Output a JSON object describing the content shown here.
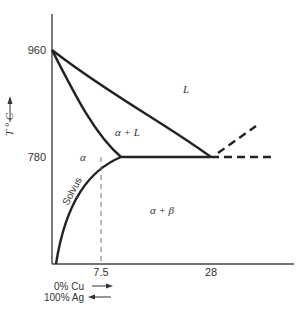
{
  "diagram": {
    "type": "phase-diagram",
    "system": "Ag-Cu",
    "y_axis": {
      "label": "T ° C",
      "ticks": [
        {
          "value": "960",
          "y": 50
        },
        {
          "value": "780",
          "y": 157
        }
      ]
    },
    "x_axis": {
      "ticks": [
        {
          "value": "7.5",
          "x": 101
        },
        {
          "value": "28",
          "x": 211
        }
      ],
      "composition_labels": [
        {
          "text": "0% Cu",
          "arrow": "right"
        },
        {
          "text": "100% Ag",
          "arrow": "left"
        }
      ]
    },
    "regions": {
      "liquid": "L",
      "alpha_liquid": "α + L",
      "alpha": "α",
      "alpha_beta": "α + β",
      "solvus": "Solvus"
    },
    "points": {
      "melting_point_ag": {
        "T": 960,
        "x_pct": 0
      },
      "max_solubility": {
        "T": 780,
        "x_pct": 7.5
      },
      "eutectic": {
        "T": 780,
        "x_pct": 28
      }
    },
    "colors": {
      "line": "#222222",
      "text": "#333333",
      "dashed_guide": "#777777"
    }
  }
}
